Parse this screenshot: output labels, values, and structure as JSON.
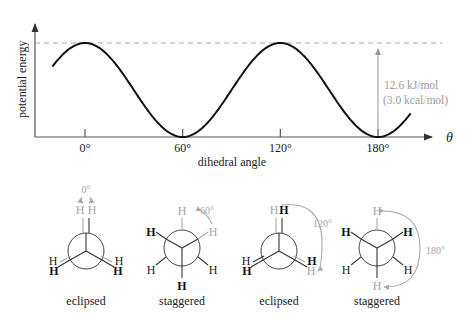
{
  "chart_data": {
    "type": "line",
    "title": "",
    "xlabel": "dihedral angle",
    "ylabel": "potential energy",
    "x_symbol": "θ",
    "x_range_deg": [
      -20,
      200
    ],
    "x_ticks": [
      0,
      60,
      120,
      180
    ],
    "x_tick_labels": [
      "0°",
      "60°",
      "120°",
      "180°"
    ],
    "series": [
      {
        "name": "torsional energy",
        "function": "E = (12.6/2) * (1 + cos(3θ))",
        "x": [
          -20,
          0,
          30,
          60,
          90,
          120,
          150,
          180,
          200
        ],
        "y": [
          3.15,
          12.6,
          6.3,
          0,
          6.3,
          12.6,
          6.3,
          0,
          3.15
        ]
      }
    ],
    "ylim": [
      0,
      12.6
    ],
    "grid": false,
    "annotations": {
      "barrier_line": "dashed at maximum energy",
      "barrier_label_1": "12.6 kJ/mol",
      "barrier_label_2": "(3.0 kcal/mol)"
    }
  },
  "conformers": [
    {
      "label": "eclipsed",
      "angle_label": "0°"
    },
    {
      "label": "staggered",
      "angle_label": "60°"
    },
    {
      "label": "eclipsed",
      "angle_label": "120°"
    },
    {
      "label": "staggered",
      "angle_label": "180°"
    }
  ],
  "atom_label": "H",
  "colors": {
    "curve": "#111111",
    "highlight": "#a5a5a5",
    "axis": "#555555"
  }
}
